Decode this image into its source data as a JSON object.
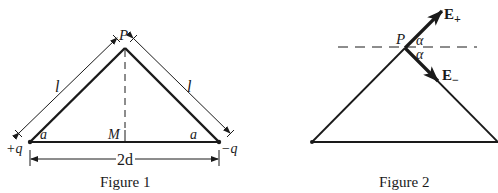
{
  "figure1": {
    "caption": "Figure 1",
    "apex_label": "P",
    "midpoint_label": "M",
    "left_charge": "+q",
    "right_charge": "−q",
    "left_angle": "a",
    "right_angle": "a",
    "left_side_length": "l",
    "right_side_length": "l",
    "base_length": "2d"
  },
  "figure2": {
    "caption": "Figure 2",
    "apex_label": "P",
    "upper_angle": "α",
    "lower_angle": "α",
    "field_plus": {
      "base": "E",
      "sub": "+"
    },
    "field_minus": {
      "base": "E",
      "sub": "−"
    }
  },
  "colors": {
    "ink": "#1a1a1a",
    "background": "#ffffff"
  }
}
